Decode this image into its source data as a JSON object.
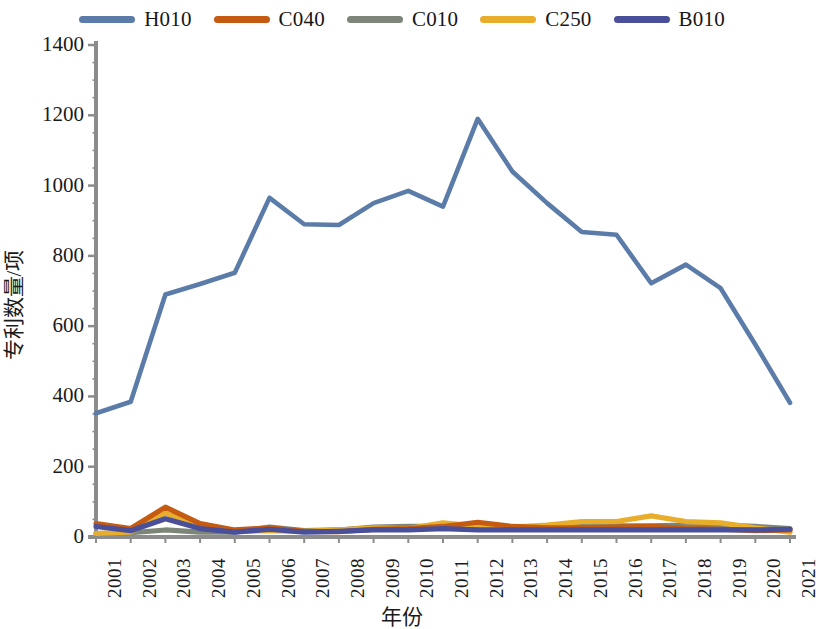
{
  "chart_data": {
    "type": "line",
    "title": "",
    "xlabel": "年份",
    "ylabel": "专利数量/项",
    "x": [
      2001,
      2002,
      2003,
      2004,
      2005,
      2006,
      2007,
      2008,
      2009,
      2010,
      2011,
      2012,
      2013,
      2014,
      2015,
      2016,
      2017,
      2018,
      2019,
      2020,
      2021
    ],
    "categories": [
      "2001",
      "2002",
      "2003",
      "2004",
      "2005",
      "2006",
      "2007",
      "2008",
      "2009",
      "2010",
      "2011",
      "2012",
      "2013",
      "2014",
      "2015",
      "2016",
      "2017",
      "2018",
      "2019",
      "2020",
      "2021"
    ],
    "ylim": [
      0,
      1400
    ],
    "yticks": [
      0,
      200,
      400,
      600,
      800,
      1000,
      1200,
      1400
    ],
    "ytick_labels": [
      "0",
      "200",
      "400",
      "600",
      "800",
      "1000",
      "1200",
      "1400"
    ],
    "grid": false,
    "legend_position": "top",
    "series": [
      {
        "name": "H010",
        "color": "#5b7ba8",
        "values": [
          352,
          385,
          690,
          720,
          752,
          965,
          890,
          888,
          950,
          985,
          940,
          1190,
          1040,
          950,
          868,
          860,
          722,
          775,
          708,
          548,
          382
        ]
      },
      {
        "name": "C040",
        "color": "#c55a11",
        "values": [
          38,
          24,
          85,
          38,
          20,
          26,
          16,
          15,
          22,
          24,
          30,
          42,
          30,
          26,
          26,
          28,
          30,
          24,
          22,
          18,
          20
        ]
      },
      {
        "name": "C010",
        "color": "#7d8578",
        "values": [
          10,
          12,
          20,
          14,
          14,
          28,
          18,
          20,
          28,
          30,
          30,
          24,
          24,
          26,
          30,
          32,
          32,
          34,
          34,
          30,
          24
        ]
      },
      {
        "name": "C250",
        "color": "#e8ad2a",
        "values": [
          10,
          14,
          68,
          32,
          16,
          18,
          16,
          20,
          26,
          24,
          40,
          30,
          28,
          34,
          44,
          44,
          60,
          44,
          40,
          26,
          14
        ]
      },
      {
        "name": "B010",
        "color": "#4a4f99",
        "values": [
          30,
          18,
          52,
          24,
          14,
          22,
          14,
          16,
          20,
          20,
          24,
          20,
          20,
          20,
          20,
          20,
          20,
          20,
          20,
          20,
          22
        ]
      }
    ]
  },
  "legend": {
    "items": [
      {
        "label": "H010",
        "color": "#5b7ba8"
      },
      {
        "label": "C040",
        "color": "#c55a11"
      },
      {
        "label": "C010",
        "color": "#7d8578"
      },
      {
        "label": "C250",
        "color": "#e8ad2a"
      },
      {
        "label": "B010",
        "color": "#4a4f99"
      }
    ]
  },
  "axes": {
    "y_label": "专利数量/项",
    "x_label": "年份",
    "axis_color": "#8c8c8c"
  }
}
